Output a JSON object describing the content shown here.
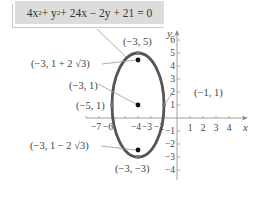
{
  "equation": {
    "parts": [
      "4x",
      "2",
      " + y",
      "2",
      " + 24x − 2y + 21 = 0"
    ],
    "text": "4x² + y² + 24x − 2y + 21 = 0"
  },
  "axes": {
    "x_label": "x",
    "y_label": "y",
    "x_ticks": [
      "−7",
      "−6",
      "−4",
      "−3",
      "−2",
      "1",
      "2",
      "3",
      "4"
    ],
    "y_ticks": [
      "6",
      "5",
      "4",
      "3",
      "2",
      "1",
      "−1",
      "−2",
      "−3",
      "−4"
    ]
  },
  "points": {
    "top_vertex": "(−3, 5)",
    "upper_focus": "(−3, 1 + 2 √3)",
    "center": "(−3, 1)",
    "left_covertex": "(−5, 1)",
    "right_covertex": "(−1, 1)",
    "lower_focus": "(−3, 1 − 2 √3)",
    "bottom_vertex": "(−3, −3)"
  },
  "colors": {
    "curve": "#555555",
    "box_fill": "#dcdcdc",
    "text": "#444444"
  }
}
